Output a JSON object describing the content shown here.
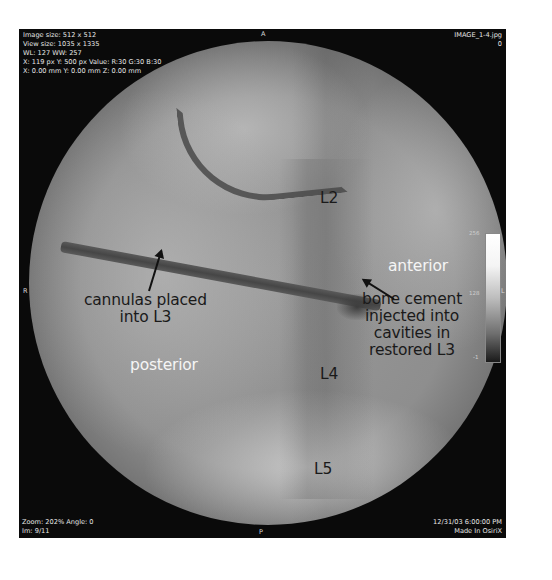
{
  "viewer": {
    "app": "OsiriX",
    "overlay_top_left": [
      "Image size: 512 x 512",
      "View size: 1035 x 1335",
      "WL: 127 WW: 257",
      "X: 119 px Y: 500 px Value: R:30 G:30 B:30",
      "X: 0.00 mm Y: 0.00 mm Z: 0.00 mm"
    ],
    "overlay_top_right": [
      "IMAGE_1-4.jpg",
      "0"
    ],
    "overlay_bottom_left": [
      "Zoom: 202% Angle: 0",
      "Im: 9/11"
    ],
    "overlay_bottom_right": [
      "12/31/03 6:00:00 PM",
      "Made In OsiriX"
    ],
    "orientation": {
      "top": "A",
      "bottom": "P",
      "left": "R",
      "right": "L"
    },
    "colorbar": {
      "max": "256",
      "mid": "128",
      "min": "-1"
    }
  },
  "annotations": {
    "l2": "L2",
    "l4": "L4",
    "l5": "L5",
    "anterior": "anterior",
    "posterior": "posterior",
    "cannula_line1": "cannulas placed",
    "cannula_line2": "into L3",
    "cement_line1": "bone cement",
    "cement_line2": "injected into",
    "cement_line3": "cavities in",
    "cement_line4": "restored L3"
  }
}
